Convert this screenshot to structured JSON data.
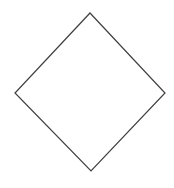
{
  "canvas": {
    "width": 174,
    "height": 188,
    "background_color": "#ffffff",
    "description": "Blank white canvas containing a single unfilled diamond outline"
  },
  "shape": {
    "name": "diamond",
    "alt_name": "rhombus",
    "kind": "polygon",
    "sides": 4,
    "filled": false,
    "fill_color": "#ffffff",
    "stroke_color": "#3f3f3f",
    "stroke_width": 1.2,
    "points": "90,13 165,93 91,171 15,93",
    "vertices": [
      {
        "label": "top",
        "x": 90,
        "y": 13
      },
      {
        "label": "right",
        "x": 165,
        "y": 93
      },
      {
        "label": "bottom",
        "x": 91,
        "y": 171
      },
      {
        "label": "left",
        "x": 15,
        "y": 93
      }
    ],
    "bounding_box": {
      "x": 15,
      "y": 13,
      "width": 150,
      "height": 158
    },
    "center": {
      "x": 90,
      "y": 92
    }
  }
}
